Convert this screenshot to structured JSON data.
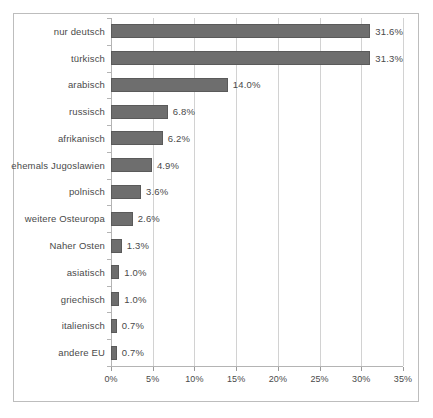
{
  "chart_data": {
    "type": "bar",
    "orientation": "horizontal",
    "title": "",
    "subtitle": "",
    "xlabel": "",
    "ylabel": "",
    "xlim": [
      0,
      35
    ],
    "xtick_labels": [
      "0%",
      "5%",
      "10%",
      "15%",
      "20%",
      "25%",
      "30%",
      "35%"
    ],
    "xtick_values": [
      0,
      5,
      10,
      15,
      20,
      25,
      30,
      35
    ],
    "grid": true,
    "legend": false,
    "bar_color": "#6e6e6e",
    "categories": [
      "nur deutsch",
      "türkisch",
      "arabisch",
      "russisch",
      "afrikanisch",
      "ehemals Jugoslawien",
      "polnisch",
      "weitere Osteuropa",
      "Naher Osten",
      "asiatisch",
      "griechisch",
      "italienisch",
      "andere EU"
    ],
    "values": [
      31.6,
      31.3,
      14.0,
      6.8,
      6.2,
      4.9,
      3.6,
      2.6,
      1.3,
      1.0,
      1.0,
      0.7,
      0.7
    ],
    "data_labels": [
      "31.6%",
      "31.3%",
      "14.0%",
      "6.8%",
      "6.2%",
      "4.9%",
      "3.6%",
      "2.6%",
      "1.3%",
      "1.0%",
      "1.0%",
      "0.7%",
      "0.7%"
    ]
  }
}
